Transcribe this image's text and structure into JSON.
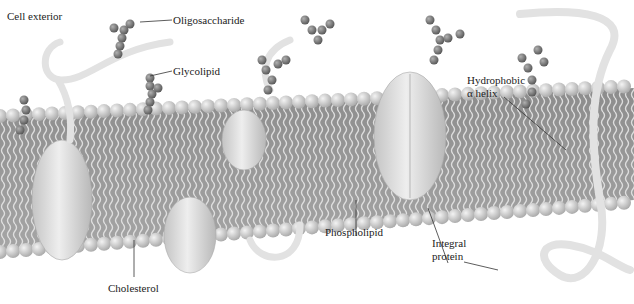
{
  "diagram": {
    "title_label": "Cell exterior",
    "labels": {
      "oligosaccharide": "Oligosaccharide",
      "glycolipid": "Glycolipid",
      "hydrophobic_line1": "Hydrophobic",
      "hydrophobic_line2": "α helix",
      "phospholipid": "Phospholipid",
      "integral_line1": "Integral",
      "integral_line2": "protein",
      "cholesterol": "Cholesterol"
    },
    "colors": {
      "head": "#cfcfcf",
      "sugar": "#7a7a7a",
      "protein": "#d8d8d8",
      "tail": "#9a9a9a",
      "leader": "#333333"
    }
  }
}
